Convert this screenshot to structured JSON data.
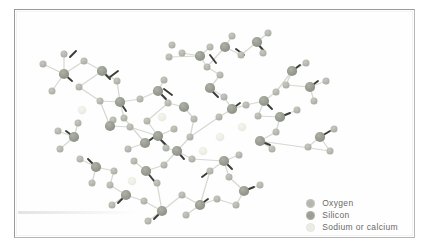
{
  "figure": {
    "background_color": "#ffffff",
    "frame_color": "#9a9a9a"
  },
  "legend": {
    "items": [
      {
        "label": "Oxygen",
        "swatch": "oxygen-swatch",
        "color": "#b3b7ad"
      },
      {
        "label": "Silicon",
        "swatch": "silicon-swatch",
        "color": "#9a9e93"
      },
      {
        "label": "Sodium or calcium",
        "swatch": "sodium-calcium-swatch",
        "color": "#e9ece3"
      }
    ]
  },
  "chart_data": {
    "type": "scatter",
    "xlabel": "",
    "ylabel": "",
    "xlim": [
      0,
      401
    ],
    "ylim": [
      0,
      229
    ],
    "grid": false,
    "legend_position": "bottom-right",
    "series": [
      {
        "name": "Oxygen",
        "color": "#b3b7ad",
        "radius": 3.6
      },
      {
        "name": "Silicon",
        "color": "#9a9e93",
        "radius": 5.2
      },
      {
        "name": "Sodium or calcium",
        "color": "#ecefe6",
        "radius": 4.2
      }
    ],
    "atoms": [
      {
        "id": 0,
        "t": "O",
        "x": 29,
        "y": 55
      },
      {
        "id": 1,
        "t": "Si",
        "x": 50,
        "y": 65
      },
      {
        "id": 2,
        "t": "O",
        "x": 50,
        "y": 45
      },
      {
        "id": 3,
        "t": "O",
        "x": 70,
        "y": 52
      },
      {
        "id": 4,
        "t": "Si",
        "x": 88,
        "y": 62
      },
      {
        "id": 5,
        "t": "O",
        "x": 103,
        "y": 72
      },
      {
        "id": 6,
        "t": "O",
        "x": 38,
        "y": 82
      },
      {
        "id": 7,
        "t": "O",
        "x": 65,
        "y": 78
      },
      {
        "id": 8,
        "t": "Na",
        "x": 68,
        "y": 101
      },
      {
        "id": 9,
        "t": "O",
        "x": 86,
        "y": 92
      },
      {
        "id": 10,
        "t": "Si",
        "x": 106,
        "y": 93
      },
      {
        "id": 11,
        "t": "O",
        "x": 110,
        "y": 109
      },
      {
        "id": 12,
        "t": "O",
        "x": 99,
        "y": 111
      },
      {
        "id": 13,
        "t": "Si",
        "x": 96,
        "y": 117
      },
      {
        "id": 14,
        "t": "O",
        "x": 116,
        "y": 118
      },
      {
        "id": 15,
        "t": "O",
        "x": 126,
        "y": 90
      },
      {
        "id": 16,
        "t": "Si",
        "x": 144,
        "y": 82
      },
      {
        "id": 17,
        "t": "O",
        "x": 150,
        "y": 71
      },
      {
        "id": 18,
        "t": "O",
        "x": 154,
        "y": 94
      },
      {
        "id": 19,
        "t": "Na",
        "x": 148,
        "y": 108
      },
      {
        "id": 20,
        "t": "O",
        "x": 133,
        "y": 112
      },
      {
        "id": 21,
        "t": "Si",
        "x": 144,
        "y": 127
      },
      {
        "id": 22,
        "t": "O",
        "x": 160,
        "y": 120
      },
      {
        "id": 23,
        "t": "O",
        "x": 152,
        "y": 139
      },
      {
        "id": 24,
        "t": "Si",
        "x": 131,
        "y": 134
      },
      {
        "id": 25,
        "t": "O",
        "x": 114,
        "y": 140
      },
      {
        "id": 26,
        "t": "O",
        "x": 155,
        "y": 48
      },
      {
        "id": 27,
        "t": "O",
        "x": 168,
        "y": 44
      },
      {
        "id": 28,
        "t": "Si",
        "x": 186,
        "y": 47
      },
      {
        "id": 29,
        "t": "O",
        "x": 196,
        "y": 38
      },
      {
        "id": 30,
        "t": "O",
        "x": 193,
        "y": 58
      },
      {
        "id": 31,
        "t": "O",
        "x": 158,
        "y": 36
      },
      {
        "id": 32,
        "t": "Si",
        "x": 211,
        "y": 38
      },
      {
        "id": 33,
        "t": "O",
        "x": 218,
        "y": 27
      },
      {
        "id": 34,
        "t": "O",
        "x": 227,
        "y": 46
      },
      {
        "id": 35,
        "t": "Si",
        "x": 243,
        "y": 33
      },
      {
        "id": 36,
        "t": "O",
        "x": 249,
        "y": 44
      },
      {
        "id": 37,
        "t": "O",
        "x": 254,
        "y": 24
      },
      {
        "id": 38,
        "t": "O",
        "x": 206,
        "y": 66
      },
      {
        "id": 39,
        "t": "Si",
        "x": 196,
        "y": 79
      },
      {
        "id": 40,
        "t": "O",
        "x": 210,
        "y": 88
      },
      {
        "id": 41,
        "t": "Si",
        "x": 218,
        "y": 100
      },
      {
        "id": 42,
        "t": "O",
        "x": 232,
        "y": 96
      },
      {
        "id": 43,
        "t": "O",
        "x": 205,
        "y": 108
      },
      {
        "id": 44,
        "t": "Si",
        "x": 250,
        "y": 92
      },
      {
        "id": 45,
        "t": "O",
        "x": 262,
        "y": 83
      },
      {
        "id": 46,
        "t": "O",
        "x": 244,
        "y": 107
      },
      {
        "id": 47,
        "t": "Si",
        "x": 266,
        "y": 108
      },
      {
        "id": 48,
        "t": "O",
        "x": 283,
        "y": 101
      },
      {
        "id": 49,
        "t": "O",
        "x": 262,
        "y": 123
      },
      {
        "id": 50,
        "t": "Na",
        "x": 228,
        "y": 118
      },
      {
        "id": 51,
        "t": "O",
        "x": 180,
        "y": 110
      },
      {
        "id": 52,
        "t": "Si",
        "x": 170,
        "y": 98
      },
      {
        "id": 53,
        "t": "O",
        "x": 176,
        "y": 128
      },
      {
        "id": 54,
        "t": "Si",
        "x": 163,
        "y": 142
      },
      {
        "id": 55,
        "t": "O",
        "x": 178,
        "y": 150
      },
      {
        "id": 56,
        "t": "O",
        "x": 150,
        "y": 156
      },
      {
        "id": 57,
        "t": "Si",
        "x": 132,
        "y": 162
      },
      {
        "id": 58,
        "t": "O",
        "x": 120,
        "y": 152
      },
      {
        "id": 59,
        "t": "O",
        "x": 143,
        "y": 174
      },
      {
        "id": 60,
        "t": "Na",
        "x": 189,
        "y": 142
      },
      {
        "id": 61,
        "t": "O",
        "x": 196,
        "y": 162
      },
      {
        "id": 62,
        "t": "Si",
        "x": 210,
        "y": 152
      },
      {
        "id": 63,
        "t": "O",
        "x": 225,
        "y": 146
      },
      {
        "id": 64,
        "t": "O",
        "x": 215,
        "y": 168
      },
      {
        "id": 65,
        "t": "Si",
        "x": 230,
        "y": 182
      },
      {
        "id": 66,
        "t": "O",
        "x": 246,
        "y": 176
      },
      {
        "id": 67,
        "t": "O",
        "x": 222,
        "y": 196
      },
      {
        "id": 68,
        "t": "O",
        "x": 203,
        "y": 190
      },
      {
        "id": 69,
        "t": "Si",
        "x": 186,
        "y": 196
      },
      {
        "id": 70,
        "t": "O",
        "x": 172,
        "y": 206
      },
      {
        "id": 71,
        "t": "O",
        "x": 168,
        "y": 186
      },
      {
        "id": 72,
        "t": "Si",
        "x": 148,
        "y": 202
      },
      {
        "id": 73,
        "t": "O",
        "x": 134,
        "y": 212
      },
      {
        "id": 74,
        "t": "O",
        "x": 130,
        "y": 192
      },
      {
        "id": 75,
        "t": "Si",
        "x": 112,
        "y": 186
      },
      {
        "id": 76,
        "t": "O",
        "x": 98,
        "y": 196
      },
      {
        "id": 77,
        "t": "O",
        "x": 96,
        "y": 176
      },
      {
        "id": 78,
        "t": "Na",
        "x": 118,
        "y": 172
      },
      {
        "id": 79,
        "t": "O",
        "x": 100,
        "y": 162
      },
      {
        "id": 80,
        "t": "Si",
        "x": 82,
        "y": 158
      },
      {
        "id": 81,
        "t": "O",
        "x": 66,
        "y": 150
      },
      {
        "id": 82,
        "t": "O",
        "x": 78,
        "y": 174
      },
      {
        "id": 83,
        "t": "Si",
        "x": 60,
        "y": 128
      },
      {
        "id": 84,
        "t": "O",
        "x": 44,
        "y": 122
      },
      {
        "id": 85,
        "t": "O",
        "x": 64,
        "y": 114
      },
      {
        "id": 86,
        "t": "O",
        "x": 46,
        "y": 140
      },
      {
        "id": 87,
        "t": "Si",
        "x": 278,
        "y": 62
      },
      {
        "id": 88,
        "t": "O",
        "x": 292,
        "y": 54
      },
      {
        "id": 89,
        "t": "O",
        "x": 272,
        "y": 76
      },
      {
        "id": 90,
        "t": "Si",
        "x": 296,
        "y": 78
      },
      {
        "id": 91,
        "t": "O",
        "x": 312,
        "y": 72
      },
      {
        "id": 92,
        "t": "O",
        "x": 300,
        "y": 92
      },
      {
        "id": 93,
        "t": "Si",
        "x": 306,
        "y": 128
      },
      {
        "id": 94,
        "t": "O",
        "x": 320,
        "y": 120
      },
      {
        "id": 95,
        "t": "O",
        "x": 294,
        "y": 138
      },
      {
        "id": 96,
        "t": "O",
        "x": 316,
        "y": 142
      },
      {
        "id": 97,
        "t": "O",
        "x": 258,
        "y": 140
      },
      {
        "id": 98,
        "t": "Si",
        "x": 246,
        "y": 132
      },
      {
        "id": 99,
        "t": "Na",
        "x": 206,
        "y": 128
      }
    ],
    "bonds": [
      [
        0,
        1
      ],
      [
        1,
        2
      ],
      [
        1,
        3
      ],
      [
        3,
        4
      ],
      [
        4,
        5
      ],
      [
        1,
        6
      ],
      [
        4,
        7
      ],
      [
        7,
        9
      ],
      [
        9,
        10
      ],
      [
        10,
        11
      ],
      [
        10,
        15
      ],
      [
        13,
        12
      ],
      [
        13,
        14
      ],
      [
        15,
        16
      ],
      [
        16,
        17
      ],
      [
        16,
        18
      ],
      [
        18,
        20
      ],
      [
        20,
        21
      ],
      [
        21,
        22
      ],
      [
        21,
        23
      ],
      [
        21,
        24
      ],
      [
        24,
        25
      ],
      [
        26,
        28
      ],
      [
        28,
        29
      ],
      [
        28,
        30
      ],
      [
        27,
        28
      ],
      [
        32,
        33
      ],
      [
        32,
        34
      ],
      [
        32,
        30
      ],
      [
        34,
        35
      ],
      [
        35,
        36
      ],
      [
        35,
        37
      ],
      [
        30,
        38
      ],
      [
        38,
        39
      ],
      [
        39,
        40
      ],
      [
        40,
        41
      ],
      [
        41,
        42
      ],
      [
        41,
        43
      ],
      [
        42,
        44
      ],
      [
        44,
        45
      ],
      [
        44,
        46
      ],
      [
        46,
        47
      ],
      [
        47,
        48
      ],
      [
        47,
        49
      ],
      [
        51,
        52
      ],
      [
        52,
        18
      ],
      [
        51,
        53
      ],
      [
        53,
        54
      ],
      [
        54,
        55
      ],
      [
        54,
        56
      ],
      [
        56,
        57
      ],
      [
        57,
        58
      ],
      [
        57,
        59
      ],
      [
        61,
        62
      ],
      [
        62,
        63
      ],
      [
        62,
        64
      ],
      [
        64,
        65
      ],
      [
        65,
        66
      ],
      [
        65,
        67
      ],
      [
        67,
        68
      ],
      [
        68,
        69
      ],
      [
        69,
        70
      ],
      [
        69,
        71
      ],
      [
        71,
        72
      ],
      [
        72,
        73
      ],
      [
        72,
        74
      ],
      [
        74,
        75
      ],
      [
        75,
        76
      ],
      [
        75,
        77
      ],
      [
        77,
        79
      ],
      [
        79,
        80
      ],
      [
        80,
        81
      ],
      [
        80,
        82
      ],
      [
        83,
        84
      ],
      [
        83,
        85
      ],
      [
        83,
        86
      ],
      [
        9,
        13
      ],
      [
        14,
        21
      ],
      [
        23,
        54
      ],
      [
        59,
        72
      ],
      [
        87,
        88
      ],
      [
        87,
        89
      ],
      [
        87,
        45
      ],
      [
        90,
        91
      ],
      [
        90,
        92
      ],
      [
        90,
        89
      ],
      [
        93,
        94
      ],
      [
        93,
        95
      ],
      [
        93,
        96
      ],
      [
        97,
        98
      ],
      [
        98,
        49
      ],
      [
        98,
        96
      ],
      [
        59,
        57
      ],
      [
        55,
        62
      ],
      [
        61,
        69
      ],
      [
        43,
        53
      ],
      [
        11,
        24
      ],
      [
        5,
        10
      ]
    ],
    "stub_bonds": [
      {
        "from": [
          56,
          48
        ],
        "to": [
          62,
          42
        ]
      },
      {
        "from": [
          96,
          68
        ],
        "to": [
          104,
          62
        ]
      },
      {
        "from": [
          150,
          80
        ],
        "to": [
          158,
          86
        ]
      },
      {
        "from": [
          196,
          46
        ],
        "to": [
          202,
          54
        ]
      },
      {
        "from": [
          222,
          40
        ],
        "to": [
          230,
          46
        ]
      },
      {
        "from": [
          243,
          34
        ],
        "to": [
          250,
          42
        ]
      },
      {
        "from": [
          196,
          80
        ],
        "to": [
          204,
          88
        ]
      },
      {
        "from": [
          218,
          100
        ],
        "to": [
          226,
          94
        ]
      },
      {
        "from": [
          250,
          92
        ],
        "to": [
          258,
          100
        ]
      },
      {
        "from": [
          266,
          108
        ],
        "to": [
          276,
          104
        ]
      },
      {
        "from": [
          106,
          93
        ],
        "to": [
          112,
          102
        ]
      },
      {
        "from": [
          132,
          134
        ],
        "to": [
          140,
          128
        ]
      },
      {
        "from": [
          144,
          128
        ],
        "to": [
          152,
          136
        ]
      },
      {
        "from": [
          163,
          142
        ],
        "to": [
          170,
          150
        ]
      },
      {
        "from": [
          132,
          162
        ],
        "to": [
          140,
          172
        ]
      },
      {
        "from": [
          112,
          186
        ],
        "to": [
          104,
          194
        ]
      },
      {
        "from": [
          148,
          202
        ],
        "to": [
          140,
          210
        ]
      },
      {
        "from": [
          186,
          196
        ],
        "to": [
          194,
          190
        ]
      },
      {
        "from": [
          230,
          182
        ],
        "to": [
          240,
          178
        ]
      },
      {
        "from": [
          210,
          152
        ],
        "to": [
          218,
          160
        ]
      },
      {
        "from": [
          82,
          158
        ],
        "to": [
          74,
          150
        ]
      },
      {
        "from": [
          60,
          128
        ],
        "to": [
          52,
          122
        ]
      },
      {
        "from": [
          296,
          78
        ],
        "to": [
          304,
          72
        ]
      },
      {
        "from": [
          306,
          128
        ],
        "to": [
          316,
          122
        ]
      },
      {
        "from": [
          88,
          62
        ],
        "to": [
          96,
          70
        ]
      },
      {
        "from": [
          50,
          65
        ],
        "to": [
          58,
          72
        ]
      },
      {
        "from": [
          278,
          62
        ],
        "to": [
          286,
          56
        ]
      },
      {
        "from": [
          246,
          132
        ],
        "to": [
          256,
          136
        ]
      },
      {
        "from": [
          144,
          82
        ],
        "to": [
          152,
          90
        ]
      },
      {
        "from": [
          196,
          162
        ],
        "to": [
          188,
          168
        ]
      }
    ]
  }
}
